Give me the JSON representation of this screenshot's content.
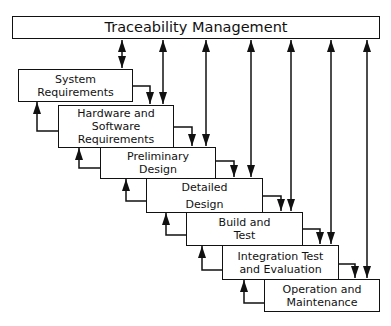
{
  "diagram": {
    "header": {
      "label": "Traceability Management",
      "x": 12,
      "y": 16,
      "w": 368,
      "h": 23
    },
    "stages": [
      {
        "id": "system-requirements",
        "lines": [
          "System",
          "Requirements"
        ],
        "x": 18,
        "y": 69,
        "w": 115,
        "h": 33
      },
      {
        "id": "hardware-software-requirements",
        "lines": [
          "Hardware and",
          "Software",
          "Requirements"
        ],
        "x": 58,
        "y": 105,
        "w": 116,
        "h": 43
      },
      {
        "id": "preliminary-design",
        "lines": [
          "Preliminary",
          "Design"
        ],
        "x": 100,
        "y": 147,
        "w": 116,
        "h": 32
      },
      {
        "id": "detailed-design",
        "lines": [
          "Detailed",
          "Design"
        ],
        "x": 146,
        "y": 178,
        "w": 117,
        "h": 35
      },
      {
        "id": "build-and-test",
        "lines": [
          "Build and",
          "Test"
        ],
        "x": 186,
        "y": 212,
        "w": 117,
        "h": 34
      },
      {
        "id": "integration-test-evaluation",
        "lines": [
          "Integration Test",
          "and Evaluation"
        ],
        "x": 222,
        "y": 245,
        "w": 117,
        "h": 35
      },
      {
        "id": "operation-maintenance",
        "lines": [
          "Operation and",
          "Maintenance"
        ],
        "x": 264,
        "y": 279,
        "w": 116,
        "h": 33
      }
    ],
    "trace_lines_x": [
      122,
      163,
      206,
      251,
      291,
      331,
      367
    ],
    "line_color": "#111111",
    "background": "#ffffff"
  }
}
